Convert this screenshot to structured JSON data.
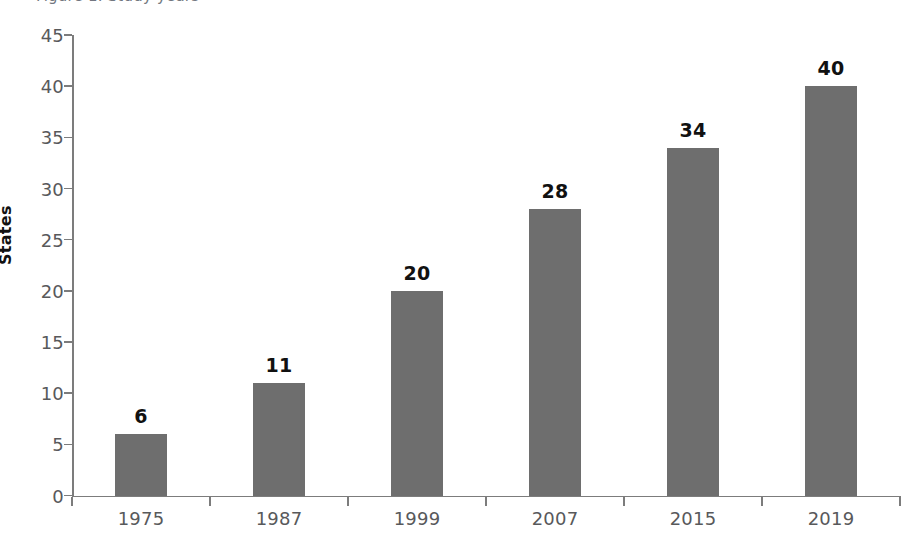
{
  "caption_fragment": "Figure 1. Study years",
  "chart_data": {
    "type": "bar",
    "title": "",
    "xlabel": "",
    "ylabel": "States",
    "categories": [
      "1975",
      "1987",
      "1999",
      "2007",
      "2015",
      "2019"
    ],
    "values": [
      6,
      11,
      20,
      28,
      34,
      40
    ],
    "value_labels": [
      "6",
      "11",
      "20",
      "28",
      "34",
      "40"
    ],
    "ylim": [
      0,
      45
    ],
    "ytick_labels": [
      "0",
      "5",
      "10",
      "15",
      "20",
      "25",
      "30",
      "35",
      "40",
      "45"
    ],
    "yticks": [
      0,
      5,
      10,
      15,
      20,
      25,
      30,
      35,
      40,
      45
    ],
    "grid": false,
    "legend": null,
    "bar_color": "#6e6e6e",
    "axis_color": "#7c7c7c",
    "tick_label_color": "#58595b",
    "value_label_color": "#111111"
  }
}
